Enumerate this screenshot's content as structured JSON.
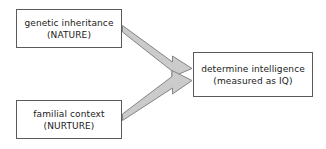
{
  "diagram": {
    "type": "flow-diagram",
    "background_color": "#ffffff",
    "node_border_color": "#5a5a5a",
    "node_fill_color": "#ffffff",
    "arrow_fill_color": "#cccccc",
    "arrow_stroke_color": "#808080",
    "text_color": "#1a1a1a",
    "nodes": [
      {
        "id": "nature",
        "line1": "genetic inheritance",
        "line2": "(NATURE)"
      },
      {
        "id": "nurture",
        "line1": "familial context",
        "line2": "(NURTURE)"
      },
      {
        "id": "outcome",
        "line1": "determine intelligence",
        "line2": "(measured as IQ)"
      }
    ],
    "edges": [
      {
        "id": "nature-to-outcome",
        "from": "nature",
        "to": "outcome",
        "label": ""
      },
      {
        "id": "nurture-to-outcome",
        "from": "nurture",
        "to": "outcome",
        "label": ""
      }
    ]
  }
}
